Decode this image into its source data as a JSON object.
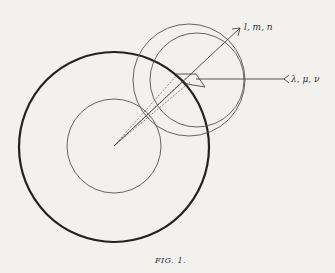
{
  "figure": {
    "caption": "FIG. 1.",
    "labels": {
      "direction_lmn": "l, m, n",
      "direction_lambda_mu_nu": "λ, μ, ν"
    },
    "elements": [
      "outer-sphere-circle",
      "inner-sphere-circle",
      "displaced-circle-left",
      "displaced-circle-right",
      "direction-arrow-lmn",
      "direction-line-lambda-mu-nu",
      "surface-element-parallelogram",
      "dashed-projection-lines"
    ]
  },
  "colors": {
    "ink": "#333333",
    "paper": "#f2f1ee"
  }
}
